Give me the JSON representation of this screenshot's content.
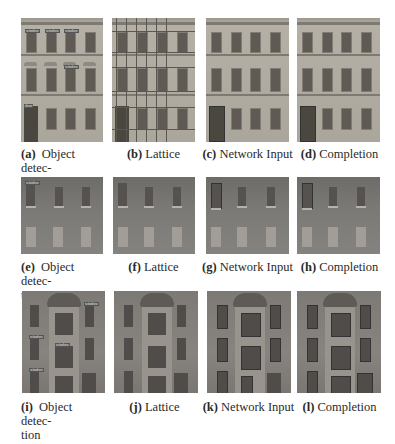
{
  "figure": {
    "rows": [
      {
        "panels": [
          {
            "letter": "(a)",
            "title": "Object detec-",
            "title_cont": "tion",
            "kind": "object-detection"
          },
          {
            "letter": "(b)",
            "title": "Lattice",
            "kind": "lattice"
          },
          {
            "letter": "(c)",
            "title": "Network Input",
            "kind": "network-input"
          },
          {
            "letter": "(d)",
            "title": "Completion",
            "kind": "completion"
          }
        ]
      },
      {
        "panels": [
          {
            "letter": "(e)",
            "title": "Object detec-",
            "title_cont": "tion",
            "kind": "object-detection"
          },
          {
            "letter": "(f)",
            "title": "Lattice",
            "kind": "lattice"
          },
          {
            "letter": "(g)",
            "title": "Network Input",
            "kind": "network-input"
          },
          {
            "letter": "(h)",
            "title": "Completion",
            "kind": "completion"
          }
        ]
      },
      {
        "panels": [
          {
            "letter": "(i)",
            "title": "Object detec-",
            "title_cont": "tion",
            "kind": "object-detection"
          },
          {
            "letter": "(j)",
            "title": "Lattice",
            "kind": "lattice"
          },
          {
            "letter": "(k)",
            "title": "Network Input",
            "kind": "network-input"
          },
          {
            "letter": "(l)",
            "title": "Completion",
            "kind": "completion"
          }
        ]
      }
    ]
  }
}
